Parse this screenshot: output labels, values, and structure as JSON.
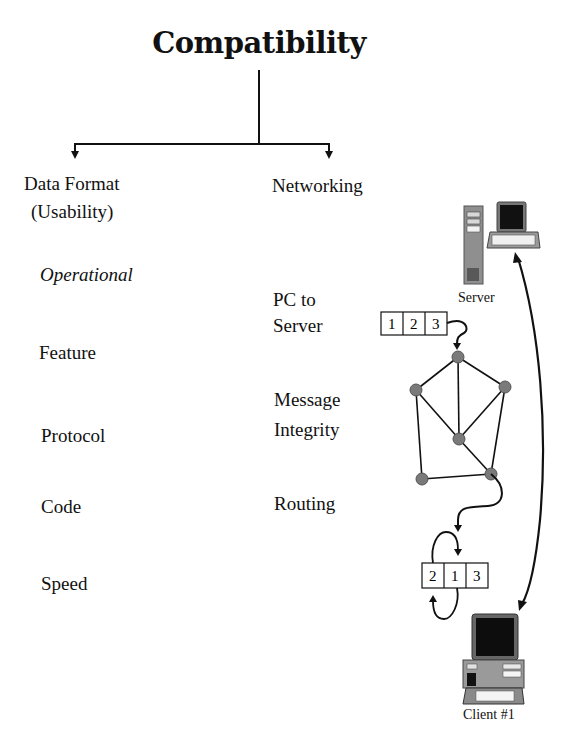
{
  "title": "Compatibility",
  "branches": {
    "left": {
      "heading_line1": "Data Format",
      "heading_line2": "(Usability)",
      "items": [
        "Operational",
        "Feature",
        "Protocol",
        "Code",
        "Speed"
      ]
    },
    "right": {
      "heading": "Networking",
      "items": [
        {
          "line1": "PC to",
          "line2": "Server"
        },
        {
          "line1": "Message",
          "line2": "Integrity"
        },
        {
          "line1": "Routing",
          "line2": ""
        }
      ]
    }
  },
  "illustration": {
    "server_label": "Server",
    "client_label": "Client #1",
    "packet_sent": [
      "1",
      "2",
      "3"
    ],
    "packet_received": [
      "2",
      "1",
      "3"
    ],
    "node_color": "#7a7a7a",
    "line_color": "#111111"
  }
}
